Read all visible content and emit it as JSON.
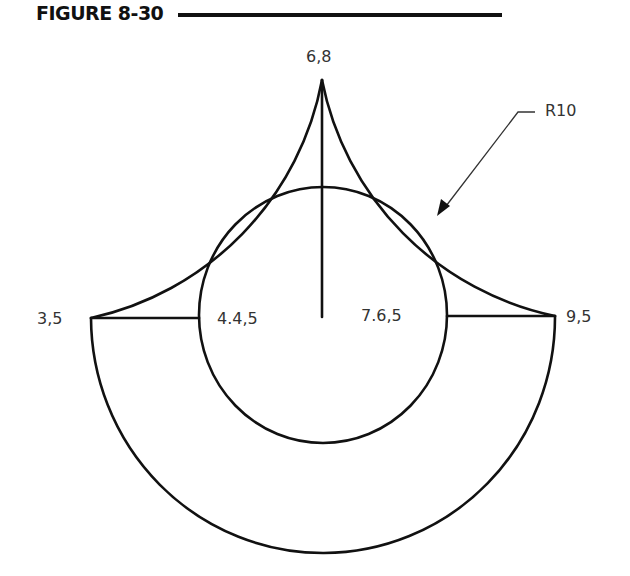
{
  "figure": {
    "title": "FIGURE 8-30",
    "labels": {
      "top": "6,8",
      "left": "3,5",
      "right": "9,5",
      "inner_left": "4.4,5",
      "inner_right": "7.6,5",
      "radius": "R10"
    },
    "colors": {
      "line": "#111111",
      "text": "#333333",
      "background": "#ffffff"
    }
  }
}
